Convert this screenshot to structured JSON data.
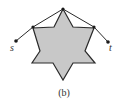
{
  "figure": {
    "caption": "(b)",
    "colors": {
      "star_fill": "#c8c8c8",
      "stroke": "#2a2a2a",
      "background": "#ffffff"
    },
    "star": {
      "points": "63,9 73,27 94,28 85,51 95,63 73,63 63,80 53,63 32,63 40,51 33,28 54,27"
    },
    "vertices": {
      "apex": {
        "x": 63,
        "y": 9
      },
      "left": {
        "x": 33,
        "y": 27
      },
      "right": {
        "x": 94,
        "y": 27
      },
      "s": {
        "x": 16,
        "y": 41
      },
      "t": {
        "x": 108,
        "y": 42
      }
    },
    "labels": {
      "s": "s",
      "t": "t"
    }
  }
}
